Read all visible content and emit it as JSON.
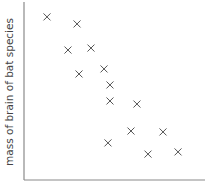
{
  "chart_data": {
    "type": "scatter",
    "title": "",
    "xlabel": "",
    "ylabel": "mass of brain of bat species",
    "xlim": [
      0,
      10
    ],
    "ylim": [
      0,
      10
    ],
    "grid": false,
    "legend": null,
    "marker": "x",
    "series": [
      {
        "name": "bat species",
        "points": [
          {
            "x": 1.27,
            "y": 9.06
          },
          {
            "x": 2.93,
            "y": 8.67
          },
          {
            "x": 2.43,
            "y": 7.22
          },
          {
            "x": 3.7,
            "y": 7.33
          },
          {
            "x": 3.04,
            "y": 5.89
          },
          {
            "x": 4.42,
            "y": 6.17
          },
          {
            "x": 4.75,
            "y": 5.28
          },
          {
            "x": 4.75,
            "y": 4.39
          },
          {
            "x": 6.24,
            "y": 4.22
          },
          {
            "x": 5.91,
            "y": 2.72
          },
          {
            "x": 7.68,
            "y": 2.67
          },
          {
            "x": 4.64,
            "y": 2.06
          },
          {
            "x": 6.85,
            "y": 1.44
          },
          {
            "x": 8.51,
            "y": 1.56
          }
        ]
      }
    ]
  }
}
